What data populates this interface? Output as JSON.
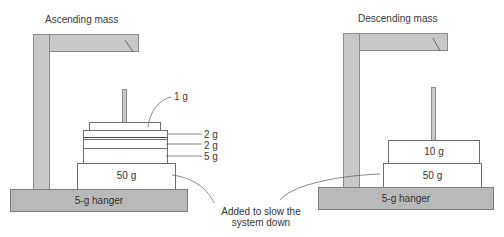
{
  "left_panel": {
    "title": "Ascending mass",
    "base_label": "5-g hanger",
    "masses": [
      {
        "id": "top",
        "label": "1 g"
      },
      {
        "id": "stack1",
        "label": "2 g"
      },
      {
        "id": "stack2",
        "label": "2 g"
      },
      {
        "id": "stack3",
        "label": "5 g"
      },
      {
        "id": "bottom",
        "label": "50 g"
      }
    ]
  },
  "right_panel": {
    "title": "Descending mass",
    "base_label": "5-g hanger",
    "masses": [
      {
        "id": "top",
        "label": "10 g"
      },
      {
        "id": "bottom",
        "label": "50 g"
      }
    ]
  },
  "annotation": {
    "line1": "Added to slow the",
    "line2": "system down"
  },
  "colors": {
    "frame_fill": "#c8c8c8",
    "base_fill": "#b9b9b9",
    "outline": "#7d7d7d",
    "plate_fill": "#ffffff",
    "text": "#333333"
  }
}
